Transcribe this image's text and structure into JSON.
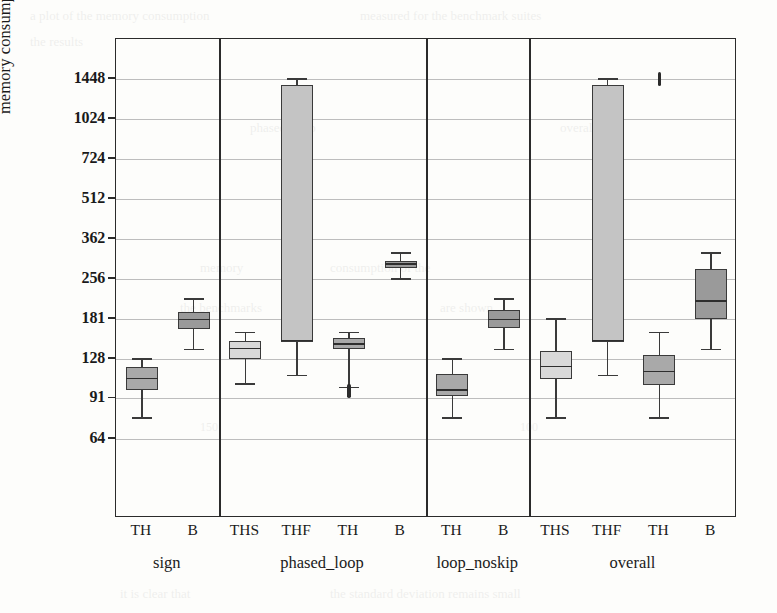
{
  "chart_data": {
    "type": "box",
    "title": "",
    "xlabel": "",
    "ylabel": "memory consumption [MiB]",
    "yscale": "log",
    "ylim": [
      52,
      1850
    ],
    "grid": true,
    "legend": "none",
    "ytick_labels": [
      "1448",
      "1024",
      "724",
      "512",
      "362",
      "256",
      "181",
      "128",
      "91",
      "64"
    ],
    "ytick_values": [
      1448,
      1024,
      724,
      512,
      362,
      256,
      181,
      128,
      91,
      64
    ],
    "group_labels": [
      "sign",
      "phased_loop",
      "loop_noskip",
      "overall"
    ],
    "groups": [
      {
        "name": "sign",
        "boxes": [
          {
            "label": "TH",
            "color": "#a9a9a9",
            "whisker_low": 77,
            "q1": 98,
            "median": 108,
            "q3": 119,
            "whisker_high": 128,
            "outliers": []
          },
          {
            "label": "B",
            "color": "#9a9a9a",
            "whisker_low": 139,
            "q1": 166,
            "median": 180,
            "q3": 192,
            "whisker_high": 215,
            "outliers": []
          }
        ]
      },
      {
        "name": "phased_loop",
        "boxes": [
          {
            "label": "THS",
            "color": "#d9d9d9",
            "whisker_low": 103,
            "q1": 128,
            "median": 140,
            "q3": 150,
            "whisker_high": 161,
            "outliers": []
          },
          {
            "label": "THF",
            "color": "#c4c4c4",
            "whisker_low": 111,
            "q1": 148,
            "median": 150,
            "q3": 1370,
            "whisker_high": 1448,
            "outliers": []
          },
          {
            "label": "TH",
            "color": "#a9a9a9",
            "whisker_low": 100,
            "q1": 139,
            "median": 146,
            "q3": 153,
            "whisker_high": 161,
            "outliers": [
              97
            ]
          },
          {
            "label": "B",
            "color": "#9a9a9a",
            "whisker_low": 256,
            "q1": 281,
            "median": 291,
            "q3": 300,
            "whisker_high": 320,
            "outliers": []
          }
        ]
      },
      {
        "name": "loop_noskip",
        "boxes": [
          {
            "label": "TH",
            "color": "#a9a9a9",
            "whisker_low": 77,
            "q1": 93,
            "median": 98,
            "q3": 112,
            "whisker_high": 128,
            "outliers": []
          },
          {
            "label": "B",
            "color": "#9a9a9a",
            "whisker_low": 139,
            "q1": 168,
            "median": 180,
            "q3": 195,
            "whisker_high": 215,
            "outliers": []
          }
        ]
      },
      {
        "name": "overall",
        "boxes": [
          {
            "label": "THS",
            "color": "#d9d9d9",
            "whisker_low": 77,
            "q1": 108,
            "median": 120,
            "q3": 137,
            "whisker_high": 181,
            "outliers": []
          },
          {
            "label": "THF",
            "color": "#c4c4c4",
            "whisker_low": 111,
            "q1": 148,
            "median": 150,
            "q3": 1370,
            "whisker_high": 1448,
            "outliers": []
          },
          {
            "label": "TH",
            "color": "#a9a9a9",
            "whisker_low": 77,
            "q1": 102,
            "median": 115,
            "q3": 133,
            "whisker_high": 161,
            "outliers": [
              1448
            ]
          },
          {
            "label": "B",
            "color": "#9a9a9a",
            "whisker_low": 139,
            "q1": 181,
            "median": 212,
            "q3": 280,
            "whisker_high": 320,
            "outliers": []
          }
        ]
      }
    ]
  },
  "ghost_text": [
    {
      "t": "a plot of the memory consumption",
      "x": 30,
      "y": 8,
      "s": 13
    },
    {
      "t": "measured for the benchmark suites",
      "x": 360,
      "y": 8,
      "s": 13
    },
    {
      "t": "the results",
      "x": 30,
      "y": 34,
      "s": 13
    },
    {
      "t": "phased_loop",
      "x": 250,
      "y": 120,
      "s": 13
    },
    {
      "t": "overall",
      "x": 560,
      "y": 120,
      "s": 13
    },
    {
      "t": "memory",
      "x": 200,
      "y": 260,
      "s": 13
    },
    {
      "t": "consumption of the",
      "x": 330,
      "y": 260,
      "s": 13
    },
    {
      "t": "the benchmarks",
      "x": 180,
      "y": 300,
      "s": 13
    },
    {
      "t": "are shown",
      "x": 440,
      "y": 300,
      "s": 13
    },
    {
      "t": "150",
      "x": 200,
      "y": 420,
      "s": 12
    },
    {
      "t": "100",
      "x": 520,
      "y": 420,
      "s": 12
    },
    {
      "t": "it is clear that",
      "x": 120,
      "y": 586,
      "s": 13
    },
    {
      "t": "the standard deviation remains small",
      "x": 330,
      "y": 586,
      "s": 13
    }
  ]
}
